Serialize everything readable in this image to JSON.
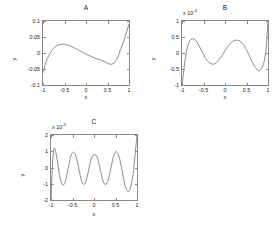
{
  "figure": {
    "background": "#ffffff",
    "line_color": "#707070",
    "axis_color": "#8a8a8a",
    "panel_count": 3
  },
  "chart_data": [
    {
      "type": "line",
      "title": "A",
      "xlabel": "x",
      "ylabel": "y",
      "xlim": [
        -1,
        1
      ],
      "ylim": [
        -0.1,
        0.1
      ],
      "xticks": [
        "-1",
        "-0.5",
        "0",
        "0.5",
        "1"
      ],
      "xtick_values": [
        -1,
        -0.5,
        0,
        0.5,
        1
      ],
      "yticks": [
        "0.1",
        "0.05",
        "0",
        "-0.05",
        "-0.1"
      ],
      "ytick_values": [
        0.1,
        0.05,
        0,
        -0.05,
        -0.1
      ],
      "exponent_label": "",
      "grid": false,
      "legend": "none",
      "x": [
        -1.0,
        -0.95,
        -0.9,
        -0.85,
        -0.8,
        -0.75,
        -0.7,
        -0.65,
        -0.6,
        -0.55,
        -0.5,
        -0.45,
        -0.4,
        -0.35,
        -0.3,
        -0.25,
        -0.2,
        -0.15,
        -0.1,
        -0.05,
        0.0,
        0.05,
        0.1,
        0.15,
        0.2,
        0.25,
        0.3,
        0.35,
        0.4,
        0.45,
        0.5,
        0.55,
        0.6,
        0.65,
        0.7,
        0.75,
        0.8,
        0.85,
        0.9,
        0.95,
        1.0
      ],
      "y": [
        -0.062,
        -0.036,
        -0.018,
        -0.004,
        0.007,
        0.015,
        0.021,
        0.025,
        0.027,
        0.0275,
        0.027,
        0.0255,
        0.0235,
        0.021,
        0.018,
        0.0145,
        0.011,
        0.0072,
        0.0035,
        0.0,
        -0.0035,
        -0.0068,
        -0.0099,
        -0.0128,
        -0.0155,
        -0.0179,
        -0.0201,
        -0.022,
        -0.0248,
        -0.0285,
        -0.0322,
        -0.0348,
        -0.0352,
        -0.0322,
        -0.0243,
        -0.0106,
        0.0097,
        0.0265,
        0.0465,
        0.0685,
        0.0905
      ]
    },
    {
      "type": "line",
      "title": "B",
      "xlabel": "x",
      "ylabel": "y",
      "xlim": [
        -1,
        1
      ],
      "ylim": [
        -1,
        1
      ],
      "xticks": [
        "-1",
        "-0.5",
        "0",
        "0.5",
        "1"
      ],
      "xtick_values": [
        -1,
        -0.5,
        0,
        0.5,
        1
      ],
      "yticks": [
        "1",
        "0.5",
        "0",
        "-0.5",
        "-1"
      ],
      "ytick_values": [
        1,
        0.5,
        0,
        -0.5,
        -1
      ],
      "exponent_label": "x 10",
      "exponent_power": "-3",
      "grid": false,
      "legend": "none",
      "x": [
        -1.0,
        -0.975,
        -0.95,
        -0.925,
        -0.9,
        -0.875,
        -0.85,
        -0.8,
        -0.75,
        -0.7,
        -0.65,
        -0.6,
        -0.55,
        -0.5,
        -0.45,
        -0.4,
        -0.35,
        -0.3,
        -0.25,
        -0.2,
        -0.15,
        -0.1,
        -0.05,
        0.0,
        0.05,
        0.1,
        0.15,
        0.2,
        0.25,
        0.3,
        0.35,
        0.4,
        0.45,
        0.5,
        0.55,
        0.6,
        0.65,
        0.7,
        0.75,
        0.8,
        0.85,
        0.9,
        0.925,
        0.95,
        0.975,
        1.0
      ],
      "y": [
        -1.0,
        -0.72,
        -0.44,
        -0.19,
        0.02,
        0.18,
        0.3,
        0.42,
        0.45,
        0.42,
        0.34,
        0.22,
        0.09,
        -0.05,
        -0.17,
        -0.26,
        -0.32,
        -0.35,
        -0.345,
        -0.3,
        -0.23,
        -0.14,
        -0.04,
        0.07,
        0.17,
        0.26,
        0.33,
        0.38,
        0.4,
        0.4,
        0.37,
        0.31,
        0.22,
        0.1,
        -0.04,
        -0.19,
        -0.33,
        -0.45,
        -0.53,
        -0.555,
        -0.5,
        -0.32,
        -0.17,
        0.05,
        0.45,
        1.0
      ]
    },
    {
      "type": "line",
      "title": "C",
      "xlabel": "x",
      "ylabel": "y",
      "xlim": [
        -1,
        1
      ],
      "ylim": [
        -2,
        2
      ],
      "xticks": [
        "-1",
        "-0.5",
        "0",
        "0.5",
        "1"
      ],
      "xtick_values": [
        -1,
        -0.5,
        0,
        0.5,
        1
      ],
      "yticks": [
        "2",
        "1",
        "0",
        "-1",
        "-2"
      ],
      "ytick_values": [
        2,
        1,
        0,
        -1,
        -2
      ],
      "exponent_label": "x 10",
      "exponent_power": "-5",
      "grid": false,
      "legend": "none",
      "x": [
        -1.0,
        -0.98,
        -0.96,
        -0.94,
        -0.92,
        -0.9,
        -0.87,
        -0.84,
        -0.8,
        -0.76,
        -0.72,
        -0.68,
        -0.64,
        -0.6,
        -0.56,
        -0.52,
        -0.48,
        -0.44,
        -0.4,
        -0.36,
        -0.32,
        -0.28,
        -0.24,
        -0.2,
        -0.16,
        -0.12,
        -0.08,
        -0.04,
        0.0,
        0.04,
        0.08,
        0.12,
        0.16,
        0.2,
        0.24,
        0.28,
        0.32,
        0.36,
        0.4,
        0.44,
        0.48,
        0.52,
        0.56,
        0.6,
        0.64,
        0.68,
        0.72,
        0.76,
        0.8,
        0.84,
        0.88,
        0.92,
        0.95,
        0.97,
        0.99,
        1.0
      ],
      "y": [
        -2.0,
        -0.6,
        0.5,
        1.05,
        1.2,
        1.1,
        0.7,
        0.2,
        -0.5,
        -0.95,
        -1.1,
        -1.0,
        -0.6,
        -0.05,
        0.5,
        0.85,
        0.95,
        0.85,
        0.5,
        0.0,
        -0.5,
        -0.9,
        -1.05,
        -0.95,
        -0.6,
        -0.1,
        0.4,
        0.7,
        0.8,
        0.78,
        0.6,
        0.2,
        -0.3,
        -0.75,
        -1.0,
        -1.05,
        -0.85,
        -0.45,
        0.05,
        0.55,
        0.9,
        1.0,
        0.85,
        0.5,
        0.0,
        -0.6,
        -1.1,
        -1.4,
        -1.5,
        -1.35,
        -0.9,
        -0.2,
        0.6,
        1.2,
        1.7,
        2.0
      ]
    }
  ]
}
